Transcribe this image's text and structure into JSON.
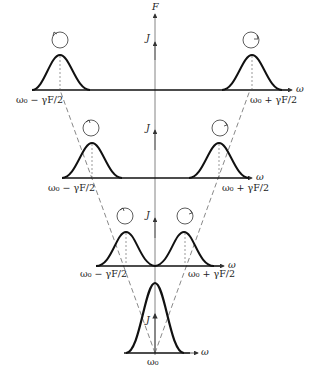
{
  "diagram": {
    "type": "spectral line splitting vs field",
    "axis": {
      "vertical_label": "F",
      "horizontal_label": "ω",
      "arrow_label": "J"
    },
    "tiers": [
      {
        "name": "tier-1",
        "left_label": "ω₀ − γF/2",
        "right_label": "ω₀ + γF/2",
        "axis_label": "ω",
        "j_label": "J"
      },
      {
        "name": "tier-2",
        "left_label": "ω₀ − γF/2",
        "right_label": "ω₀ + γF/2",
        "axis_label": "ω",
        "j_label": "J"
      },
      {
        "name": "tier-3",
        "left_label": "ω₀ − γF/2",
        "right_label": "ω₀ + γF/2",
        "axis_label": "ω",
        "j_label": "J"
      },
      {
        "name": "tier-4",
        "center_label": "ω₀",
        "axis_label": "ω",
        "j_label": "J"
      }
    ],
    "colors": {
      "line": "#111111",
      "axis": "#555555",
      "dashed": "#555555"
    }
  }
}
